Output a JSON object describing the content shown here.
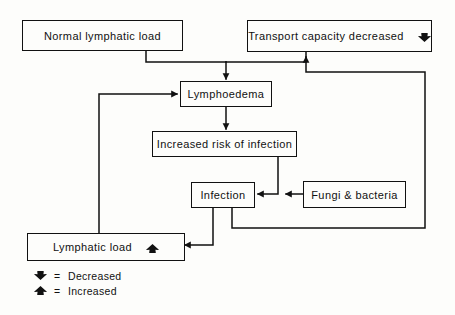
{
  "diagram": {
    "line_color": "#111111",
    "background_color": "#fdfdfb",
    "nodes": [
      {
        "id": "normal_lymphatic_load",
        "label": "Normal lymphatic load",
        "trend": ""
      },
      {
        "id": "transport_capacity_decreased",
        "label": "Transport capacity decreased",
        "trend": "decreased"
      },
      {
        "id": "lymphoedema",
        "label": "Lymphoedema",
        "trend": ""
      },
      {
        "id": "increased_risk_of_infection",
        "label": "Increased risk of infection",
        "trend": ""
      },
      {
        "id": "infection",
        "label": "Infection",
        "trend": ""
      },
      {
        "id": "fungi_and_bacteria",
        "label": "Fungi & bacteria",
        "trend": ""
      },
      {
        "id": "lymphatic_load",
        "label": "Lymphatic load",
        "trend": "increased"
      }
    ],
    "edges": [
      {
        "from": "normal_lymphatic_load",
        "to": "lymphoedema"
      },
      {
        "from": "transport_capacity_decreased",
        "to": "lymphoedema"
      },
      {
        "from": "lymphoedema",
        "to": "increased_risk_of_infection"
      },
      {
        "from": "increased_risk_of_infection",
        "to": "infection"
      },
      {
        "from": "fungi_and_bacteria",
        "to": "infection"
      },
      {
        "from": "infection",
        "to": "lymphatic_load"
      },
      {
        "from": "infection",
        "to": "transport_capacity_decreased"
      },
      {
        "from": "lymphatic_load",
        "to": "lymphoedema"
      }
    ],
    "legend": [
      {
        "glyph": "decreased",
        "equals": "=",
        "text": "Decreased"
      },
      {
        "glyph": "increased",
        "equals": "=",
        "text": "Increased"
      }
    ]
  }
}
